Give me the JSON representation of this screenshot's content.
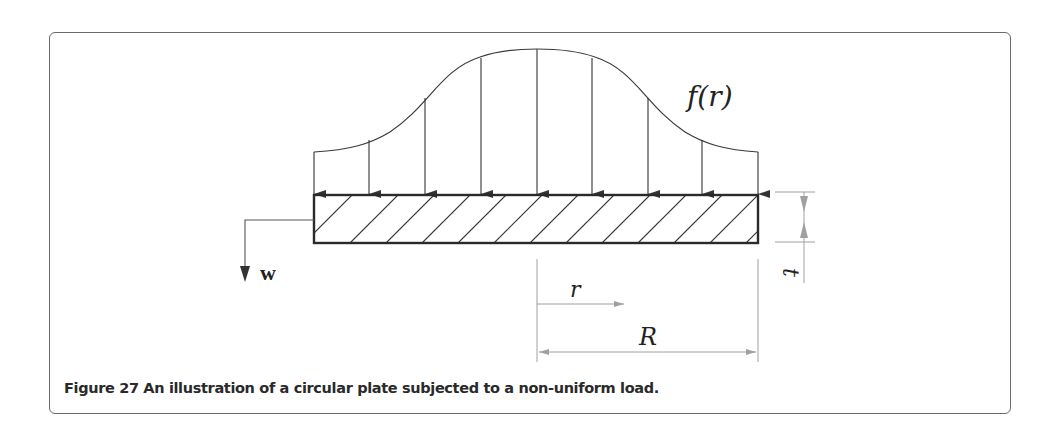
{
  "figure": {
    "caption": "Figure 27 An illustration of a circular plate subjected to a non-uniform load.",
    "labels": {
      "load_function": "f(r)",
      "deflection": "w",
      "radius_coord": "r",
      "radius": "R",
      "thickness": "t"
    },
    "colors": {
      "line": "#333333",
      "dimension": "#9a9a9a",
      "frame": "#6a6a6a"
    },
    "load_arrows_count": 9,
    "hatch_lines_count": 13
  }
}
